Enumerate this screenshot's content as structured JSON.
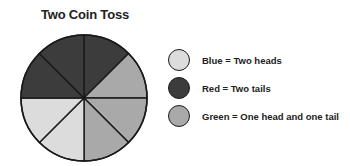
{
  "chart_data": {
    "type": "pie",
    "title": "Two Coin Toss",
    "slices": [
      {
        "index": 0,
        "start_deg": 90,
        "end_deg": 45,
        "category": "Red"
      },
      {
        "index": 1,
        "start_deg": 45,
        "end_deg": 0,
        "category": "Green"
      },
      {
        "index": 2,
        "start_deg": 0,
        "end_deg": -45,
        "category": "Green"
      },
      {
        "index": 3,
        "start_deg": -45,
        "end_deg": -90,
        "category": "Green"
      },
      {
        "index": 4,
        "start_deg": -90,
        "end_deg": -135,
        "category": "Blue"
      },
      {
        "index": 5,
        "start_deg": -135,
        "end_deg": -180,
        "category": "Blue"
      },
      {
        "index": 6,
        "start_deg": 180,
        "end_deg": 135,
        "category": "Red"
      },
      {
        "index": 7,
        "start_deg": 135,
        "end_deg": 90,
        "category": "Red"
      }
    ],
    "categories": [
      "Blue",
      "Red",
      "Green"
    ],
    "values": [
      2,
      3,
      3
    ],
    "total_slices": 8,
    "legend": [
      {
        "key": "Blue",
        "label": "Blue = Two heads",
        "color": "#dcdcdc"
      },
      {
        "key": "Red",
        "label": "Red = Two tails",
        "color": "#3c3c3c"
      },
      {
        "key": "Green",
        "label": "Green = One head and one tail",
        "color": "#a9a9a9"
      }
    ],
    "legend_position": "right"
  },
  "colors": {
    "Blue": "#dcdcdc",
    "Red": "#3c3c3c",
    "Green": "#a9a9a9",
    "stroke": "#1a1a1a"
  }
}
